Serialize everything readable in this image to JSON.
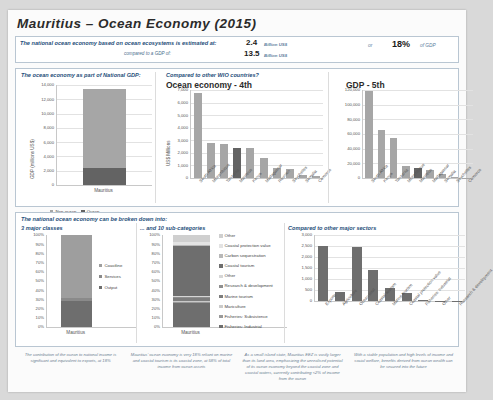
{
  "title": "Mauritius  –  Ocean Economy (2015)",
  "headline": {
    "label": "The national ocean economy based on ocean ecosystems is estimated at:",
    "sub_label": "compared to a GDP of:",
    "value_ocean": "2.4",
    "unit_ocean": "Billion US$",
    "value_gdp": "13.5",
    "unit_gdp": "Billion US$",
    "or_label": "or",
    "share_value": "18%",
    "share_label": "of GDP"
  },
  "top_section": {
    "left_header": "The ocean economy as part of National GDP:",
    "mid_header": "Compared to other WIO countries?",
    "mid_title": "Ocean economy - 4th",
    "right_title": "GDP - 5th",
    "legend": [
      {
        "label": "Non-ocean",
        "color": "#a6a6a6"
      },
      {
        "label": "Ocean",
        "color": "#636363"
      }
    ]
  },
  "bottom_section": {
    "header": "The national ocean economy can be broken down into:",
    "left_header": "3 major classes",
    "mid_header": "... and 10 sub-categories",
    "right_header": "Compared to other major sectors"
  },
  "footer": [
    "The contribution of the ocean to national income is significant and equivalent to exports, at 18%",
    "Mauritius' ocean economy is very 18% reliant on marine and coastal tourism is its coastal zone, at 58% of total income from ocean assets",
    "As a small island state, Mauritius EEZ is vastly larger than its land area, emphasizing the unrealised potential of its ocean economy beyond the coastal zone and coastal waters, currently contributing <2% of income from the ocean",
    "With a stable population and high levels of income and social welfare, benefits derived from ocean wealth can be secured into the future"
  ],
  "chart_data": [
    {
      "id": "gdp_share",
      "type": "bar",
      "title": "",
      "ylabel": "GDP (millions US$)",
      "categories": [
        "Mauritius"
      ],
      "ylim": [
        0,
        14000
      ],
      "yticks": [
        "0",
        "2,000",
        "4,000",
        "6,000",
        "8,000",
        "10,000",
        "12,000",
        "14,000"
      ],
      "series": [
        {
          "name": "Non-ocean",
          "values": [
            11100
          ],
          "color": "#a6a6a6"
        },
        {
          "name": "Ocean",
          "values": [
            2400
          ],
          "color": "#636363"
        }
      ],
      "grid": true
    },
    {
      "id": "ocean_economy_wio",
      "type": "bar",
      "title": "Ocean economy - 4th",
      "ylabel": "US$ Millions",
      "ylim": [
        0,
        7000
      ],
      "yticks": [
        "0",
        "1,000",
        "2,000",
        "3,000",
        "4,000",
        "5,000",
        "6,000",
        "7,000"
      ],
      "categories": [
        "South Africa",
        "Mozambique",
        "Tanzania",
        "Mauritius",
        "Kenya",
        "Madagascar",
        "Reunion",
        "Seychelles",
        "Somalia",
        "Comoros"
      ],
      "values": [
        6800,
        2750,
        2730,
        2400,
        2350,
        1600,
        800,
        700,
        220,
        150
      ],
      "highlight_index": 3,
      "grid": true
    },
    {
      "id": "gdp_wio",
      "type": "bar",
      "title": "GDP - 5th",
      "ylabel": "",
      "ylim": [
        0,
        120000
      ],
      "yticks": [
        "0",
        "20,000",
        "40,000",
        "60,000",
        "80,000",
        "100,000",
        "120,000"
      ],
      "categories": [
        "South Africa",
        "Kenya",
        "Tanzania",
        "Mozambique",
        "Mauritius",
        "Madagascar",
        "Somalia",
        "Seychelles",
        "Comoros"
      ],
      "values": [
        119000,
        66000,
        55000,
        17000,
        13500,
        11000,
        5500,
        1800,
        600
      ],
      "highlight_index": 4,
      "grid": true
    },
    {
      "id": "three_major_classes",
      "type": "stacked_bar",
      "title": "3 major classes",
      "ylabel": "",
      "ylim": [
        0,
        100
      ],
      "yticks": [
        "0%",
        "10%",
        "20%",
        "30%",
        "40%",
        "50%",
        "60%",
        "70%",
        "80%",
        "90%",
        "100%"
      ],
      "categories": [
        "Mauritius"
      ],
      "series": [
        {
          "name": "Coastline",
          "values": [
            68
          ],
          "color": "#9e9e9e"
        },
        {
          "name": "Services",
          "values": [
            4
          ],
          "color": "#8a8a8a"
        },
        {
          "name": "Output",
          "values": [
            28
          ],
          "color": "#6e6e6e"
        }
      ],
      "grid": false
    },
    {
      "id": "ten_subcategories",
      "type": "stacked_bar",
      "title": "... and 10 sub-categories",
      "ylabel": "",
      "ylim": [
        0,
        100
      ],
      "yticks": [
        "0%",
        "10%",
        "20%",
        "30%",
        "40%",
        "50%",
        "60%",
        "70%",
        "80%",
        "90%",
        "100%"
      ],
      "categories": [
        "Mauritius"
      ],
      "series": [
        {
          "name": "Other",
          "values": [
            8
          ],
          "color": "#cfcfcf"
        },
        {
          "name": "Coastal protection value",
          "values": [
            3
          ],
          "color": "#e3e3e3"
        },
        {
          "name": "Carbon sequestration",
          "values": [
            1
          ],
          "color": "#b8b8b8"
        },
        {
          "name": "Coastal tourism",
          "values": [
            54
          ],
          "color": "#6e6e6e"
        },
        {
          "name": "Other",
          "values": [
            1
          ],
          "color": "#d6d6d6"
        },
        {
          "name": "Research & development",
          "values": [
            1
          ],
          "color": "#8f8f8f"
        },
        {
          "name": "Marine tourism",
          "values": [
            4
          ],
          "color": "#7d7d7d"
        },
        {
          "name": "Mariculture",
          "values": [
            1
          ],
          "color": "#cacaca"
        },
        {
          "name": "Fisheries: Subsistence",
          "values": [
            1
          ],
          "color": "#9a9a9a"
        },
        {
          "name": "Fisheries: Industrial",
          "values": [
            26
          ],
          "color": "#6e6e6e"
        }
      ],
      "grid": false
    },
    {
      "id": "major_sectors",
      "type": "bar",
      "title": "Compared to other major sectors",
      "ylabel": "",
      "ylim": [
        0,
        3000
      ],
      "yticks": [
        "0",
        "500",
        "1,000",
        "1,500",
        "2,000",
        "2,500",
        "3,000"
      ],
      "categories": [
        "Exports",
        "Agriculture",
        "Ocean total",
        "Coastal tourism",
        "Marine tourism",
        "Coastal protection value",
        "Fisheries: Industrial",
        "Other",
        "Research & development"
      ],
      "values": [
        2500,
        400,
        2450,
        1400,
        580,
        380,
        60,
        20,
        10
      ],
      "grid": true
    }
  ]
}
